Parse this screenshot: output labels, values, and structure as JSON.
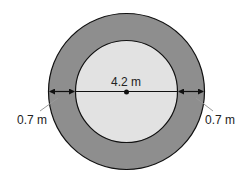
{
  "diagram": {
    "type": "concentric-circles-annulus",
    "inner_diameter_label": "4.2 m",
    "ring_width_left_label": "0.7 m",
    "ring_width_right_label": "0.7 m",
    "colors": {
      "outer_ring": "#8e8e8e",
      "inner_circle": "#e2e2e2",
      "stroke": "#111111",
      "leader": "#999999"
    }
  }
}
